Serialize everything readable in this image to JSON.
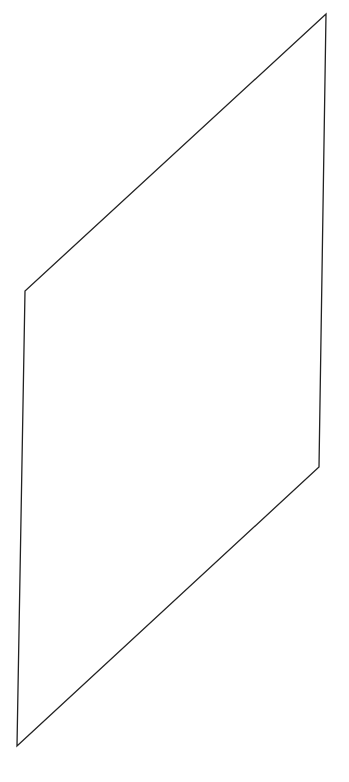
{
  "canvas": {
    "width": 349,
    "height": 782,
    "background": "#ffffff"
  },
  "shape": {
    "type": "parallelogram",
    "stroke": "#222222",
    "stroke_width": 1.3,
    "fill": "none",
    "points": "326,14 319,467 17,746 25,291"
  }
}
